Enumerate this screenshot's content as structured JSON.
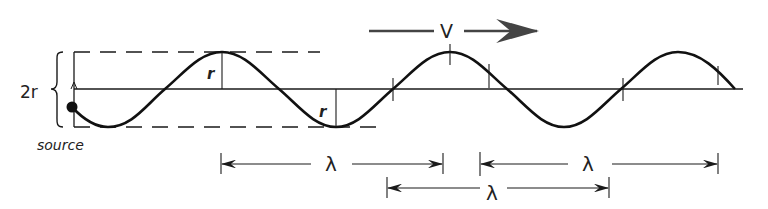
{
  "diagram": {
    "title": "",
    "labels": {
      "amplitude_bracket": "2r",
      "source": "source",
      "radius_crest": "r",
      "radius_trough": "r",
      "velocity": "V",
      "wavelength_1": "λ",
      "wavelength_2": "λ",
      "wavelength_3": "λ"
    },
    "colors": {
      "ink": "#1a1a1a",
      "background": "#ffffff"
    },
    "wave": {
      "axis_y": 89,
      "amplitude_px": 37.5,
      "wavelength_px": 228,
      "start_x": 72,
      "end_x": 735,
      "crests_x": [
        222,
        450,
        678
      ],
      "troughs_x": [
        108,
        336,
        564
      ]
    }
  }
}
